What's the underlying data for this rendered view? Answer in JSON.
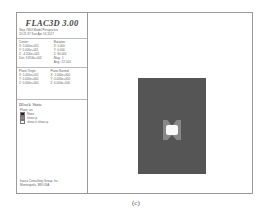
{
  "app": {
    "title": "FLAC3D 3.00",
    "header_lines": [
      "Step 7663 Model Perspective",
      "20:21:37 Sun Apr 16 2017"
    ]
  },
  "view": {
    "center_label": "Center:",
    "center": [
      "X: 5.000e+001",
      "Y: 5.000e+001",
      "Z: -4.500e+001"
    ],
    "dist": "Dist: 3.816e+002",
    "rotation_label": "Rotation:",
    "rotation": [
      "X: 0.000",
      "Y: 0.000",
      "Z: 90.000"
    ],
    "mag": "Mag.: 1",
    "ang": "Ang.: 22.500"
  },
  "plane": {
    "origin_label": "Plane Origin:",
    "origin": [
      "X: 5.000e+001",
      "Y: 0.000e+000",
      "Z: 0.000e+000"
    ],
    "normal_label": "Plane Normal:",
    "normal": [
      "X: 1.000e+000",
      "Y: 0.000e+000",
      "Z: 0.000e+000"
    ]
  },
  "legend": {
    "title": "Block State",
    "subtitle": "Plane: on",
    "items": [
      {
        "label": "None",
        "color": "#222222"
      },
      {
        "label": "shear-p",
        "color": "#888888"
      },
      {
        "label": "shear-n shear-p",
        "color": "#f4f4f4"
      }
    ]
  },
  "footer": [
    "Itasca Consulting Group, Inc.",
    "Minneapolis, MN  USA"
  ],
  "plot": {
    "block_color": "#555555",
    "plastic_color": "#888888",
    "hole_color": "#fafafa"
  },
  "caption": "(c)"
}
